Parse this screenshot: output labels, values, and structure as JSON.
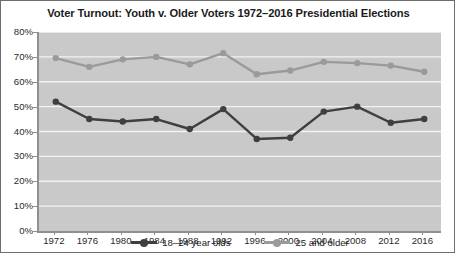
{
  "chart_data": {
    "type": "line",
    "title": "Voter Turnout: Youth v. Older Voters 1972–2016 Presidential Elections",
    "xlabel": "",
    "ylabel": "",
    "categories": [
      "1972",
      "1976",
      "1980",
      "1984",
      "1988",
      "1992",
      "1996",
      "2000",
      "2004",
      "2008",
      "2012",
      "2016"
    ],
    "series": [
      {
        "name": "18–24 year olds",
        "color": "#3f3f3f",
        "values": [
          52,
          45,
          44,
          45,
          41,
          49,
          37,
          37.5,
          48,
          50,
          43.5,
          45
        ]
      },
      {
        "name": "25 and older",
        "color": "#9a9a9a",
        "values": [
          69.5,
          66,
          69,
          70,
          67,
          71.5,
          63,
          64.5,
          68,
          67.5,
          66.5,
          64
        ]
      }
    ],
    "ylim": [
      0,
      80
    ],
    "ytick_values": [
      0,
      10,
      20,
      30,
      40,
      50,
      60,
      70,
      80
    ],
    "ytick_labels": [
      "0%",
      "10%",
      "20%",
      "30%",
      "40%",
      "50%",
      "60%",
      "70%",
      "80%"
    ],
    "grid": true,
    "grid_color": "#f2f2f2",
    "plot_background": "#c9c9c9",
    "legend_position": "bottom-center"
  }
}
